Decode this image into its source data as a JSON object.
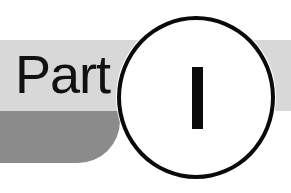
{
  "heading": {
    "label": "Part",
    "numeral": "I"
  },
  "colors": {
    "background": "#ffffff",
    "band_light": "#d8d8d8",
    "band_dark": "#8b8b8b",
    "ink": "#0a0a0a"
  }
}
